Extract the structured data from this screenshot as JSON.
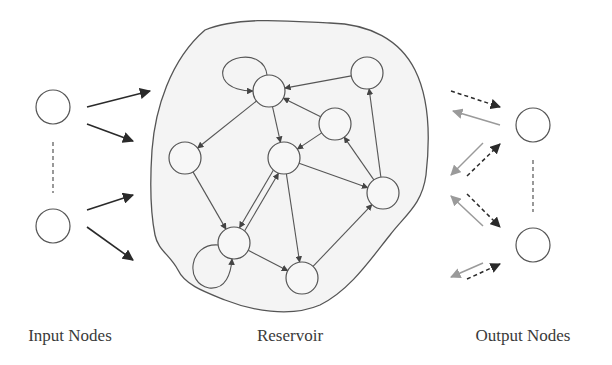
{
  "labels": {
    "input": "Input Nodes",
    "reservoir": "Reservoir",
    "output": "Output Nodes"
  },
  "colors": {
    "stroke": "#555555",
    "arrow_dark": "#2a2a2a",
    "arrow_light": "#9a9a9a",
    "reservoir_fill": "#f4f4f4",
    "background": "#ffffff"
  },
  "input_nodes": [
    {
      "id": "in1",
      "x": 53,
      "y": 107,
      "r": 17
    },
    {
      "id": "in2",
      "x": 53,
      "y": 226,
      "r": 17
    }
  ],
  "output_nodes": [
    {
      "id": "out1",
      "x": 533,
      "y": 125,
      "r": 17
    },
    {
      "id": "out2",
      "x": 533,
      "y": 245,
      "r": 17
    }
  ],
  "reservoir_nodes": [
    {
      "id": "A",
      "x": 269,
      "y": 91,
      "r": 16
    },
    {
      "id": "B",
      "x": 367,
      "y": 73,
      "r": 16
    },
    {
      "id": "C",
      "x": 335,
      "y": 124,
      "r": 16
    },
    {
      "id": "D",
      "x": 185,
      "y": 158,
      "r": 16
    },
    {
      "id": "E",
      "x": 284,
      "y": 158,
      "r": 16
    },
    {
      "id": "F",
      "x": 383,
      "y": 193,
      "r": 16
    },
    {
      "id": "G",
      "x": 234,
      "y": 243,
      "r": 16
    },
    {
      "id": "H",
      "x": 302,
      "y": 278,
      "r": 16
    }
  ],
  "reservoir_edges": [
    {
      "from": "B",
      "to": "A"
    },
    {
      "from": "C",
      "to": "A"
    },
    {
      "from": "A",
      "to": "D"
    },
    {
      "from": "A",
      "to": "E"
    },
    {
      "from": "C",
      "to": "E"
    },
    {
      "from": "F",
      "to": "C"
    },
    {
      "from": "F",
      "to": "B"
    },
    {
      "from": "E",
      "to": "F"
    },
    {
      "from": "D",
      "to": "G"
    },
    {
      "from": "E",
      "to": "G"
    },
    {
      "from": "G",
      "to": "E"
    },
    {
      "from": "E",
      "to": "H"
    },
    {
      "from": "G",
      "to": "H"
    },
    {
      "from": "H",
      "to": "F"
    }
  ],
  "self_loops": [
    "A",
    "G"
  ],
  "input_arrows": [
    {
      "x1": 87,
      "y1": 107,
      "x2": 150,
      "y2": 91
    },
    {
      "x1": 87,
      "y1": 124,
      "x2": 133,
      "y2": 141
    },
    {
      "x1": 87,
      "y1": 210,
      "x2": 133,
      "y2": 195
    },
    {
      "x1": 87,
      "y1": 227,
      "x2": 133,
      "y2": 260
    }
  ],
  "output_arrows": [
    {
      "x1": 451,
      "y1": 91,
      "x2": 500,
      "y2": 107,
      "style": "dashed"
    },
    {
      "x1": 500,
      "y1": 125,
      "x2": 453,
      "y2": 111,
      "style": "light"
    },
    {
      "x1": 483,
      "y1": 143,
      "x2": 451,
      "y2": 175,
      "style": "light"
    },
    {
      "x1": 467,
      "y1": 176,
      "x2": 500,
      "y2": 144,
      "style": "dashed"
    },
    {
      "x1": 467,
      "y1": 194,
      "x2": 500,
      "y2": 227,
      "style": "dashed"
    },
    {
      "x1": 483,
      "y1": 226,
      "x2": 451,
      "y2": 196,
      "style": "light"
    },
    {
      "x1": 483,
      "y1": 263,
      "x2": 451,
      "y2": 277,
      "style": "light"
    },
    {
      "x1": 467,
      "y1": 279,
      "x2": 500,
      "y2": 264,
      "style": "dashed"
    }
  ]
}
